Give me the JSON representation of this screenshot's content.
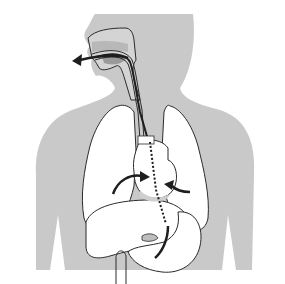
{
  "figure": {
    "colors": {
      "background": "#ffffff",
      "body_fill": "#c9c9c9",
      "organ_fill": "#ffffff",
      "outline": "#2b2b2b",
      "palate_fill": "#b0b0b0",
      "tongue_fill": "#9a9a9a",
      "arrow": "#1e1e1e"
    },
    "elements": [
      "head-neck-torso-silhouette",
      "oral-cavity-airway",
      "tube-through-esophagus",
      "left-lung",
      "right-lung",
      "heart",
      "liver",
      "stomach",
      "exhale-arrow-from-mouth",
      "arrow-into-heart-left",
      "arrow-into-heart-right",
      "dotted-path-to-stomach"
    ],
    "labels": []
  }
}
